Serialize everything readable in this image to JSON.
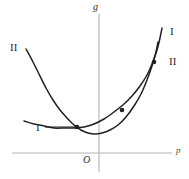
{
  "figure": {
    "axes": {
      "y_axis_label": "g",
      "x_axis_label": "p",
      "origin_label": "O",
      "axis_color": "#b4b4b4",
      "x_axis": {
        "x_start": 12,
        "x_end": 172,
        "y": 153
      },
      "y_axis": {
        "x": 99,
        "y_start": 14,
        "y_end": 172
      }
    },
    "curve_color": "#231f20",
    "labels": {
      "curve_II_left": "II",
      "curve_I_right": "I",
      "curve_II_right": "II",
      "curve_I_left": "I"
    },
    "leader_line": {
      "x_start": 45,
      "x_end": 77,
      "y": 127
    },
    "curves": [
      {
        "name": "I",
        "label": "I",
        "points": [
          [
            24,
            121
          ],
          [
            34,
            124
          ],
          [
            44,
            126
          ],
          [
            54,
            128
          ],
          [
            64,
            128
          ],
          [
            74,
            128
          ],
          [
            84,
            127
          ],
          [
            94,
            124
          ],
          [
            104,
            119
          ],
          [
            114,
            112
          ],
          [
            124,
            104
          ],
          [
            132,
            96
          ],
          [
            140,
            86
          ],
          [
            147,
            75
          ],
          [
            152,
            64
          ],
          [
            157,
            50
          ],
          [
            160,
            38
          ],
          [
            162,
            28
          ]
        ]
      },
      {
        "name": "II",
        "label": "II",
        "points": [
          [
            26,
            49
          ],
          [
            32,
            60
          ],
          [
            39,
            74
          ],
          [
            46,
            88
          ],
          [
            53,
            100
          ],
          [
            60,
            110
          ],
          [
            67,
            118
          ],
          [
            74,
            125
          ],
          [
            81,
            130
          ],
          [
            88,
            133
          ],
          [
            95,
            134
          ],
          [
            102,
            133
          ],
          [
            110,
            130
          ],
          [
            118,
            125
          ],
          [
            126,
            117
          ],
          [
            134,
            106
          ],
          [
            141,
            94
          ],
          [
            147,
            80
          ],
          [
            152,
            66
          ],
          [
            156,
            52
          ],
          [
            158,
            42
          ]
        ]
      }
    ],
    "intersection_dots": [
      {
        "x": 77,
        "y": 127
      },
      {
        "x": 122,
        "y": 110
      },
      {
        "x": 154,
        "y": 62
      }
    ]
  }
}
